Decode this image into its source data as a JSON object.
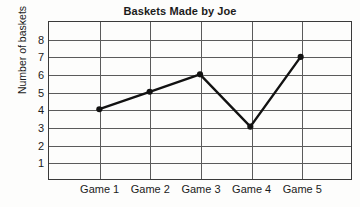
{
  "chart_data": {
    "type": "line",
    "title": "Baskets Made by Joe",
    "xlabel": "",
    "ylabel": "Number of baskets",
    "categories": [
      "Game 1",
      "Game 2",
      "Game 3",
      "Game 4",
      "Game 5"
    ],
    "values": [
      4,
      5,
      6,
      3,
      7
    ],
    "series": [
      {
        "name": "Baskets",
        "values": [
          4,
          5,
          6,
          3,
          7
        ]
      }
    ],
    "ylim": [
      0,
      9
    ],
    "y_ticks": [
      1,
      2,
      3,
      4,
      5,
      6,
      7,
      8
    ],
    "grid": true,
    "legend": false,
    "legend_position": "none",
    "marker": "filled-circle",
    "line_color": "#121212",
    "grid_color": "#5b5b5b",
    "frame_color": "#3a3a3a",
    "background_color": "#fdfdfc"
  }
}
